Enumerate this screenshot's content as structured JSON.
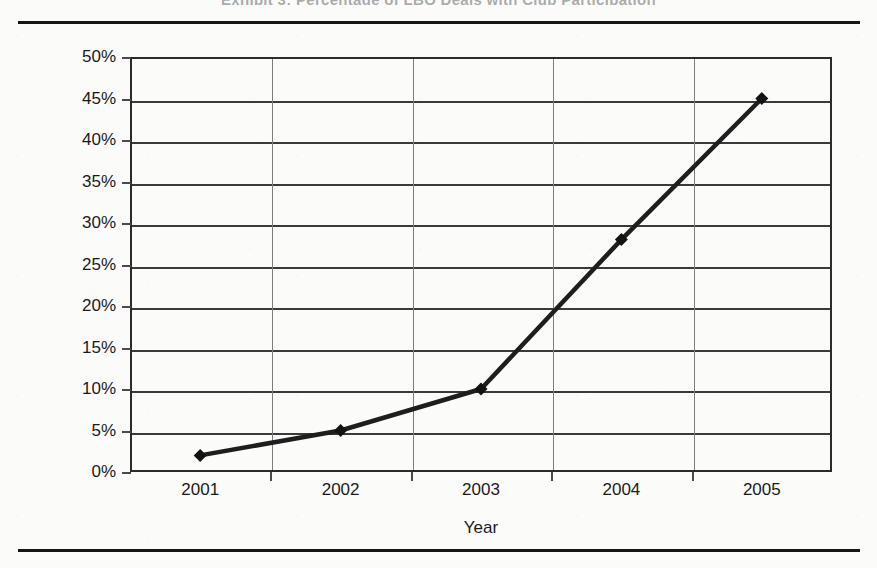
{
  "page": {
    "title_sliver": "Exhibit 3: Percentage of LBO Deals with Club Participation",
    "rule_top_name": "top-horizontal-rule",
    "rule_bottom_name": "bottom-horizontal-rule"
  },
  "chart_data": {
    "type": "line",
    "title": "",
    "xlabel": "Year",
    "ylabel": "Percentage of LBO Deals",
    "categories": [
      "2001",
      "2002",
      "2003",
      "2004",
      "2005"
    ],
    "values": [
      2,
      5,
      10,
      28,
      45
    ],
    "ylim": [
      0,
      50
    ],
    "ytick_step": 5,
    "ytick_labels": [
      "0%",
      "5%",
      "10%",
      "15%",
      "20%",
      "25%",
      "30%",
      "35%",
      "40%",
      "45%",
      "50%"
    ],
    "ytick_values": [
      0,
      5,
      10,
      15,
      20,
      25,
      30,
      35,
      40,
      45,
      50
    ],
    "grid": "horizontal",
    "legend": "none",
    "series_name": "Percentage of LBO Deals",
    "marker": "diamond",
    "line_color": "#1e1e1e",
    "marker_color": "#131313",
    "grid_color": "#3a3a3a",
    "axis_color": "#2b2b2b",
    "background": "#fbfbfa"
  }
}
